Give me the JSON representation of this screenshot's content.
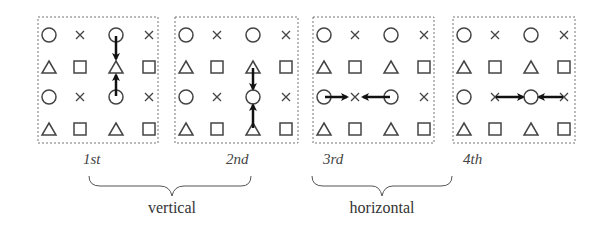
{
  "figure": {
    "grid_pattern": [
      [
        "circle",
        "cross",
        "circle",
        "cross"
      ],
      [
        "triangle",
        "square",
        "triangle",
        "square"
      ],
      [
        "circle",
        "cross",
        "circle",
        "cross"
      ],
      [
        "triangle",
        "square",
        "triangle",
        "square"
      ]
    ],
    "panels": [
      {
        "label": "1st",
        "direction": "vertical",
        "arrows": [
          {
            "from": [
              0,
              2
            ],
            "to": [
              1,
              2
            ]
          },
          {
            "from": [
              2,
              2
            ],
            "to": [
              1,
              2
            ]
          }
        ]
      },
      {
        "label": "2nd",
        "direction": "vertical",
        "arrows": [
          {
            "from": [
              1,
              2
            ],
            "to": [
              2,
              2
            ]
          },
          {
            "from": [
              3,
              2
            ],
            "to": [
              2,
              2
            ]
          }
        ]
      },
      {
        "label": "3rd",
        "direction": "horizontal",
        "arrows": [
          {
            "from": [
              2,
              0
            ],
            "to": [
              2,
              1
            ]
          },
          {
            "from": [
              2,
              2
            ],
            "to": [
              2,
              1
            ]
          }
        ]
      },
      {
        "label": "4th",
        "direction": "horizontal",
        "arrows": [
          {
            "from": [
              2,
              1
            ],
            "to": [
              2,
              2
            ]
          },
          {
            "from": [
              2,
              3
            ],
            "to": [
              2,
              2
            ]
          }
        ]
      }
    ],
    "groups": [
      {
        "label": "vertical",
        "panels": [
          "1st",
          "2nd"
        ]
      },
      {
        "label": "horizontal",
        "panels": [
          "3rd",
          "4th"
        ]
      }
    ]
  },
  "colors": {
    "stroke": "#444444",
    "arrow": "#111111",
    "border": "#777777"
  }
}
